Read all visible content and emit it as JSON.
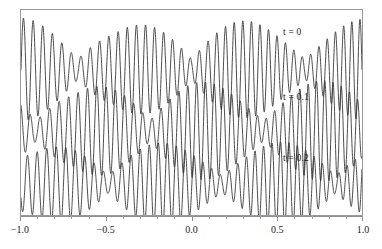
{
  "figure": {
    "background_color": "#ffffff",
    "frame_color": "#9a9a9a",
    "curve_color": "#3a3a3a"
  },
  "chart_data": {
    "type": "line",
    "title": "",
    "xlabel": "",
    "ylabel": "",
    "xlim": [
      -1.0,
      1.0
    ],
    "ylim": [
      -1.0,
      1.0
    ],
    "grid": false,
    "legend_position": "inline-right",
    "x_ticks": [
      -1.0,
      -0.5,
      0.0,
      0.5,
      1.0
    ],
    "x_tick_labels": [
      "-1.0",
      "-0.5",
      "0.0",
      "0.5",
      "1.0"
    ],
    "minor_ticks_per_interval": 4,
    "y_ticks": [],
    "y_tick_labels": [],
    "series": [
      {
        "name": "t = 0",
        "label": "t = 0",
        "label_x": 0.6,
        "row": 0,
        "carrier_cycles": 35,
        "envelope_cycles": 3.0,
        "envelope_phase": 0.0,
        "envelope_floor": 0.2,
        "amplitude": 1.0
      },
      {
        "name": "t = 0.1",
        "label": "t = 0.1",
        "label_x": 0.6,
        "row": 1,
        "carrier_cycles": 35,
        "envelope_cycles": 3.0,
        "envelope_phase": 1.15,
        "envelope_floor": 0.2,
        "amplitude": 1.0
      },
      {
        "name": "t = 0.2",
        "label": "t = 0.2",
        "label_x": 0.6,
        "row": 2,
        "carrier_cycles": 35,
        "envelope_cycles": 3.0,
        "envelope_phase": 2.3,
        "envelope_floor": 0.2,
        "amplitude": 1.0
      }
    ]
  }
}
